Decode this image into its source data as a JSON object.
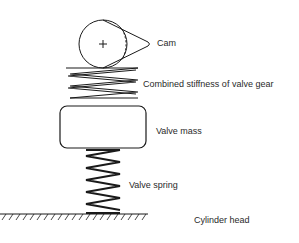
{
  "diagram": {
    "type": "mechanical-schematic",
    "labels": {
      "cam": "Cam",
      "combined_stiffness": "Combined stiffness of valve gear",
      "valve_mass": "Valve mass",
      "valve_spring": "Valve spring",
      "cylinder_head": "Cylinder head"
    },
    "components": [
      {
        "id": "cam",
        "shape": "circle-with-lobe",
        "center_symbol": "+"
      },
      {
        "id": "combined_stiffness",
        "shape": "zigzag-spring"
      },
      {
        "id": "valve_mass",
        "shape": "rounded-rectangle"
      },
      {
        "id": "valve_spring",
        "shape": "coil-spring"
      },
      {
        "id": "cylinder_head",
        "shape": "hatched-ground"
      }
    ],
    "colors": {
      "stroke": "#1a1a1a",
      "text": "#2a2a2a",
      "background": "#ffffff"
    }
  }
}
